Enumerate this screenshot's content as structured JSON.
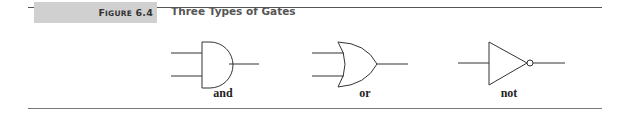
{
  "figure": {
    "label_prefix": "F",
    "label_smallcaps": "IGURE",
    "label_number": "6.4",
    "label_full": "Figure 6.4",
    "title": "Three Types of Gates"
  },
  "gates": [
    {
      "name": "and",
      "label": "and",
      "inputs": 2
    },
    {
      "name": "or",
      "label": "or",
      "inputs": 2
    },
    {
      "name": "not",
      "label": "not",
      "inputs": 1
    }
  ],
  "colors": {
    "label_bar": "#d0d0d0",
    "stroke": "#333333",
    "title": "#555555"
  }
}
